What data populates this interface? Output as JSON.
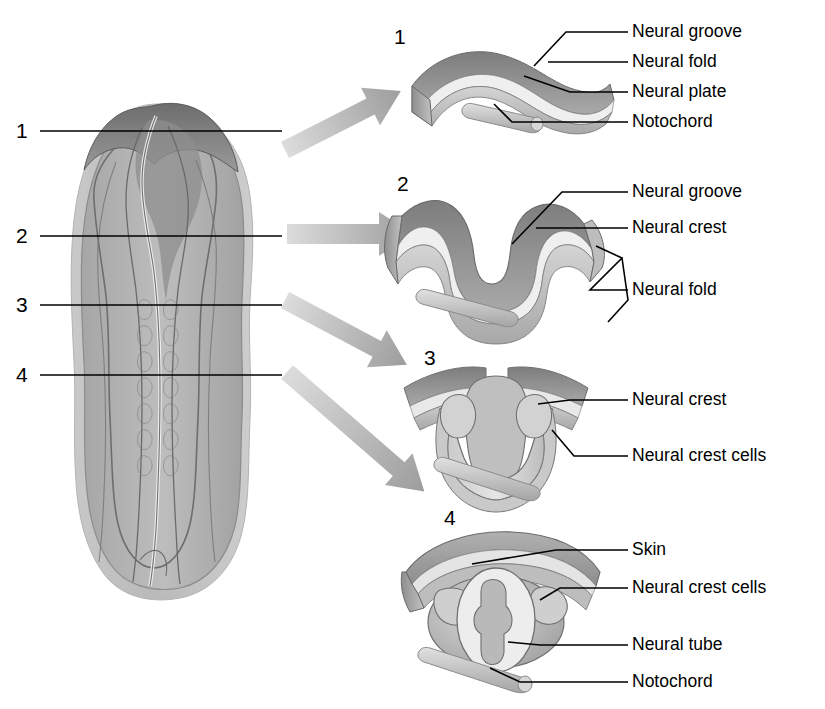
{
  "figure": {
    "title_visible": false,
    "stage_numbers": [
      "1",
      "2",
      "3",
      "4"
    ],
    "accent_color": "#000000",
    "tissue_gray_dark": "#6f6f6f",
    "tissue_gray_mid": "#9a9a9a",
    "tissue_gray_light": "#cfcfcf",
    "arrow_gray": "#b4b4b4"
  },
  "embryo": {
    "name": "neurula-embryo-dorsal-view",
    "level_numbers": [
      {
        "id": "1",
        "label": "1"
      },
      {
        "id": "2",
        "label": "2"
      },
      {
        "id": "3",
        "label": "3"
      },
      {
        "id": "4",
        "label": "4"
      }
    ]
  },
  "panels": [
    {
      "number": "1",
      "labels": [
        {
          "text": "Neural groove"
        },
        {
          "text": "Neural fold"
        },
        {
          "text": "Neural plate"
        },
        {
          "text": "Notochord"
        }
      ]
    },
    {
      "number": "2",
      "labels": [
        {
          "text": "Neural groove"
        },
        {
          "text": "Neural crest"
        },
        {
          "text": "Neural fold"
        }
      ]
    },
    {
      "number": "3",
      "labels": [
        {
          "text": "Neural crest"
        },
        {
          "text": "Neural crest cells"
        }
      ]
    },
    {
      "number": "4",
      "labels": [
        {
          "text": "Skin"
        },
        {
          "text": "Neural crest cells"
        },
        {
          "text": "Neural tube"
        },
        {
          "text": "Notochord"
        }
      ]
    }
  ]
}
